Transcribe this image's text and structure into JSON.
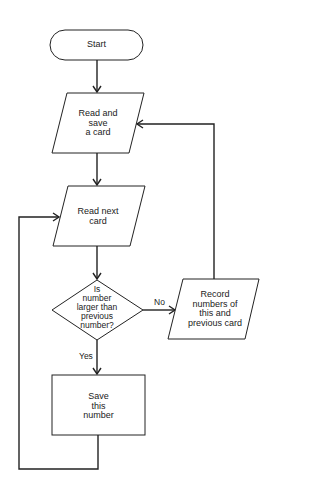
{
  "diagram": {
    "type": "flowchart",
    "nodes": [
      {
        "id": "start",
        "shape": "terminal",
        "label": "Start"
      },
      {
        "id": "read_save",
        "shape": "parallelogram",
        "label": "Read and\nsave\na card"
      },
      {
        "id": "read_next",
        "shape": "parallelogram",
        "label": "Read next\ncard"
      },
      {
        "id": "decision",
        "shape": "diamond",
        "label": "Is\nnumber\nlarger than\nprevious\nnumber?"
      },
      {
        "id": "record",
        "shape": "parallelogram",
        "label": "Record\nnumbers of\nthis and\nprevious card"
      },
      {
        "id": "save_number",
        "shape": "rectangle",
        "label": "Save\nthis\nnumber"
      }
    ],
    "edges": [
      {
        "from": "start",
        "to": "read_save",
        "label": ""
      },
      {
        "from": "read_save",
        "to": "read_next",
        "label": ""
      },
      {
        "from": "read_next",
        "to": "decision",
        "label": ""
      },
      {
        "from": "decision",
        "to": "record",
        "label": "No"
      },
      {
        "from": "decision",
        "to": "save_number",
        "label": "Yes"
      },
      {
        "from": "record",
        "to": "read_save",
        "label": ""
      },
      {
        "from": "save_number",
        "to": "read_next",
        "label": ""
      }
    ],
    "edge_labels": {
      "no": "No",
      "yes": "Yes"
    },
    "colors": {
      "stroke": "#222222",
      "background": "#ffffff"
    }
  }
}
